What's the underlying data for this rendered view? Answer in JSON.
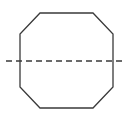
{
  "figure": {
    "canvas": {
      "width": 130,
      "height": 122,
      "background_color": "#ffffff"
    },
    "shape": {
      "name": "octagon",
      "sides": 8,
      "stroke_color": "#3a3a3a",
      "stroke_width": 1.3,
      "fill": "none",
      "points": "40,13 93,13 113,34 113,87 93,108 40,108 20,87 20,34",
      "bounds": {
        "left": 20,
        "right": 113,
        "top": 13,
        "bottom": 108
      },
      "vertices": [
        {
          "label": "top-left",
          "x": 40,
          "y": 13
        },
        {
          "label": "top-right",
          "x": 93,
          "y": 13
        },
        {
          "label": "right-top",
          "x": 113,
          "y": 34
        },
        {
          "label": "right-bottom",
          "x": 113,
          "y": 87
        },
        {
          "label": "bottom-right",
          "x": 93,
          "y": 108
        },
        {
          "label": "bottom-left",
          "x": 40,
          "y": 108
        },
        {
          "label": "left-bottom",
          "x": 20,
          "y": 87
        },
        {
          "label": "left-top",
          "x": 20,
          "y": 34
        }
      ]
    },
    "symmetry_line": {
      "name": "horizontal-axis-of-symmetry",
      "orientation": "horizontal",
      "x1": 6,
      "y1": 61,
      "x2": 124,
      "y2": 61,
      "stroke_color": "#3a3a3a",
      "stroke_width": 1.4,
      "dash_length": 6,
      "gap_length": 4
    },
    "caption": {
      "text": "",
      "color": "#f2f2f2"
    }
  }
}
